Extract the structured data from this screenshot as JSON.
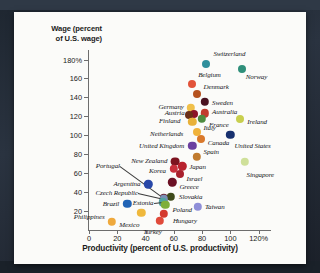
{
  "chart_data": {
    "type": "scatter",
    "title": "",
    "xlabel": "Productivity (percent of U.S. productivity)",
    "ylabel": "Wage (percent of U.S. wage)",
    "xlim": [
      0,
      128
    ],
    "ylim": [
      0,
      190
    ],
    "xticks": [
      "0",
      "20",
      "40",
      "60",
      "80",
      "100",
      "120%"
    ],
    "xtick_values": [
      0,
      20,
      40,
      60,
      80,
      100,
      120
    ],
    "yticks": [
      "180%",
      "160",
      "140",
      "120",
      "100",
      "80",
      "60",
      "40",
      "20"
    ],
    "ytick_values": [
      180,
      160,
      140,
      120,
      100,
      80,
      60,
      40,
      20
    ],
    "grid": false,
    "legend": "none",
    "points": [
      {
        "name": "Switzerland",
        "x": 83,
        "y": 175,
        "color": "#2f8f9c",
        "r": 4.0,
        "lx": 7,
        "ly": -10,
        "anchor": "start"
      },
      {
        "name": "Norway",
        "x": 108,
        "y": 170,
        "color": "#2f8f7a",
        "r": 4.0,
        "lx": 4,
        "ly": 8,
        "anchor": "start"
      },
      {
        "name": "Belgium",
        "x": 73,
        "y": 154,
        "color": "#e2533a",
        "r": 4.0,
        "lx": 6,
        "ly": -9,
        "anchor": "start"
      },
      {
        "name": "Denmark",
        "x": 76,
        "y": 143,
        "color": "#b5521f",
        "r": 4.0,
        "lx": 7,
        "ly": -7,
        "anchor": "start"
      },
      {
        "name": "Sweden",
        "x": 82,
        "y": 135,
        "color": "#4a1220",
        "r": 4.2,
        "lx": 7,
        "ly": 1,
        "anchor": "start"
      },
      {
        "name": "Germany",
        "x": 72,
        "y": 129,
        "color": "#f0c04a",
        "r": 4.2,
        "lx": -7,
        "ly": -1,
        "anchor": "end"
      },
      {
        "name": "Austria",
        "x": 74,
        "y": 122,
        "color": "#8c1428",
        "r": 4.0,
        "lx": -9,
        "ly": -1,
        "anchor": "end"
      },
      {
        "name": "Australia",
        "x": 82,
        "y": 123,
        "color": "#c23b2e",
        "r": 4.2,
        "lx": 7,
        "ly": -1,
        "anchor": "start"
      },
      {
        "name": "Finland",
        "x": 71,
        "y": 121,
        "color": "#6b2f18",
        "r": 4.0,
        "lx": -9,
        "ly": 6,
        "anchor": "end"
      },
      {
        "name": "France",
        "x": 80,
        "y": 117,
        "color": "#4f8b3f",
        "r": 4.2,
        "lx": 7,
        "ly": 6,
        "anchor": "start"
      },
      {
        "name": "Netherlands",
        "x": 73,
        "y": 114,
        "color": "#e8b13a",
        "r": 4.2,
        "lx": -9,
        "ly": 12,
        "anchor": "end"
      },
      {
        "name": "Ireland",
        "x": 107,
        "y": 117,
        "color": "#c8cf4e",
        "r": 4.0,
        "lx": 7,
        "ly": 3,
        "anchor": "start"
      },
      {
        "name": "Italy",
        "x": 76,
        "y": 103,
        "color": "#f0b33c",
        "r": 4.0,
        "lx": 7,
        "ly": -4,
        "anchor": "start"
      },
      {
        "name": "Canada",
        "x": 79,
        "y": 96,
        "color": "#d9792c",
        "r": 4.0,
        "lx": 7,
        "ly": 4,
        "anchor": "start"
      },
      {
        "name": "United States",
        "x": 100,
        "y": 100,
        "color": "#17306e",
        "r": 4.2,
        "lx": 4,
        "ly": 11,
        "anchor": "start"
      },
      {
        "name": "United Kingdom",
        "x": 73,
        "y": 89,
        "color": "#6b3fa0",
        "r": 4.2,
        "lx": -8,
        "ly": 0,
        "anchor": "end"
      },
      {
        "name": "Spain",
        "x": 76,
        "y": 77,
        "color": "#c07a2e",
        "r": 4.2,
        "lx": 7,
        "ly": -5,
        "anchor": "start"
      },
      {
        "name": "New Zealand",
        "x": 61,
        "y": 72,
        "color": "#7d1420",
        "r": 4.4,
        "lx": -8,
        "ly": -1,
        "anchor": "end"
      },
      {
        "name": "Japan",
        "x": 66,
        "y": 67,
        "color": "#b8222e",
        "r": 4.2,
        "lx": 7,
        "ly": 1,
        "anchor": "start"
      },
      {
        "name": "Korea",
        "x": 60,
        "y": 64,
        "color": "#c9303c",
        "r": 4.2,
        "lx": -8,
        "ly": 2,
        "anchor": "end"
      },
      {
        "name": "Israel",
        "x": 64,
        "y": 59,
        "color": "#a8202c",
        "r": 4.0,
        "lx": 7,
        "ly": 5,
        "anchor": "start"
      },
      {
        "name": "Portugal",
        "x": 53,
        "y": 33,
        "color": "#6b2a3c",
        "r": 4.2,
        "lx": -44,
        "ly": -32,
        "anchor": "end",
        "leader": true
      },
      {
        "name": "Singapore",
        "x": 110,
        "y": 72,
        "color": "#cfe09a",
        "r": 4.2,
        "lx": 2,
        "ly": 13,
        "anchor": "start"
      },
      {
        "name": "Greece",
        "x": 59,
        "y": 50,
        "color": "#6b1024",
        "r": 4.2,
        "lx": 7,
        "ly": 5,
        "anchor": "start"
      },
      {
        "name": "Argentina",
        "x": 42,
        "y": 48,
        "color": "#2747a8",
        "r": 4.2,
        "lx": -8,
        "ly": 0,
        "anchor": "end"
      },
      {
        "name": "Slovakia",
        "x": 58,
        "y": 35,
        "color": "#3e4a1a",
        "r": 4.2,
        "lx": 8,
        "ly": 0,
        "anchor": "start"
      },
      {
        "name": "Czech Republic",
        "x": 53,
        "y": 32,
        "color": "#7a8fb5",
        "r": 4.2,
        "lx": -26,
        "ly": -6,
        "anchor": "end",
        "leader": true
      },
      {
        "name": "Estonia",
        "x": 52,
        "y": 29,
        "color": "#4fa3a0",
        "r": 4.2,
        "lx": -9,
        "ly": 1,
        "anchor": "end",
        "leader": true
      },
      {
        "name": "Poland",
        "x": 54,
        "y": 26,
        "color": "#7fae3a",
        "r": 4.2,
        "lx": 7,
        "ly": 5,
        "anchor": "start"
      },
      {
        "name": "Brazil",
        "x": 27,
        "y": 27,
        "color": "#2063b5",
        "r": 4.2,
        "lx": -8,
        "ly": 0,
        "anchor": "end"
      },
      {
        "name": "Taiwan",
        "x": 77,
        "y": 24,
        "color": "#8f8fd8",
        "r": 4.2,
        "lx": 7,
        "ly": 0,
        "anchor": "start"
      },
      {
        "name": "Hungary",
        "x": 53,
        "y": 17,
        "color": "#d43a2e",
        "r": 4.2,
        "lx": 9,
        "ly": 7,
        "anchor": "start"
      },
      {
        "name": "Mexico",
        "x": 37,
        "y": 18,
        "color": "#efb83c",
        "r": 4.2,
        "lx": -2,
        "ly": 12,
        "anchor": "end"
      },
      {
        "name": "Turkey",
        "x": 50,
        "y": 9,
        "color": "#e04a3a",
        "r": 4.2,
        "lx": 2,
        "ly": 11,
        "anchor": "end"
      },
      {
        "name": "Philippines",
        "x": 16,
        "y": 8,
        "color": "#efa93c",
        "r": 4.2,
        "lx": -7,
        "ly": -5,
        "anchor": "end"
      }
    ]
  }
}
